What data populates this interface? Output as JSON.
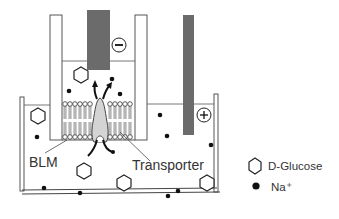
{
  "diagram": {
    "labels": {
      "blm": "BLM",
      "transporter": "Transporter"
    },
    "electrodes": {
      "negative": {
        "symbol": "−",
        "color": "#6b6b6b"
      },
      "positive": {
        "symbol": "+",
        "color": "#6b6b6b"
      }
    },
    "legend": {
      "items": [
        {
          "icon": "hexagon-icon",
          "label": "D-Glucose"
        },
        {
          "icon": "dot-icon",
          "label": "Na⁺"
        }
      ]
    },
    "colors": {
      "electrode": "#6b6b6b",
      "transporter": "#d4d4d4",
      "outline": "#333333",
      "ink": "#111111"
    }
  }
}
